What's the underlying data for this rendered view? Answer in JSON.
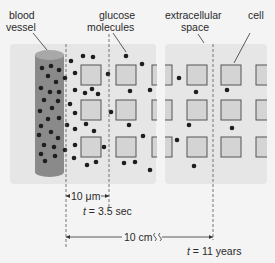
{
  "labels": {
    "blood_vessel_line1": "blood",
    "blood_vessel_line2": "vessel",
    "glucose_line1": "glucose",
    "glucose_line2": "molecules",
    "extracellular_line1": "extracellular",
    "extracellular_line2": "space",
    "cell": "cell"
  },
  "measurements": {
    "short_distance": "10 μm",
    "short_time_var": "t",
    "short_time_value": " = 3.5 sec",
    "long_distance": "10 cm",
    "long_time_var": "t",
    "long_time_value": " = 11 years"
  },
  "colors": {
    "background": "#f4f4f4",
    "panel": "#e6e6e6",
    "vessel_body": "#8a8a8a",
    "vessel_top": "#a8a8a8",
    "cell_fill": "#d4d4d4",
    "cell_stroke": "#555555",
    "molecule": "#1e1e1e"
  }
}
